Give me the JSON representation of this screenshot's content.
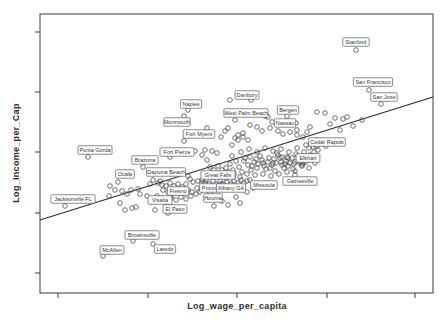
{
  "chart_data": {
    "type": "scatter",
    "title": "",
    "xlabel": "Log_wage_per_capita",
    "ylabel": "Log_Income_per_Cap",
    "legend": null,
    "grid": false,
    "axis_tick_numbers_visible": false,
    "colors": {
      "background": "#ffffff",
      "axis": "#3a3a3a",
      "point_stroke": "#4a4a4a",
      "line": "#2b2b2b",
      "label_box_fill": "#ffffff",
      "label_box_stroke": "#5a5a5a",
      "label_text": "#333333"
    },
    "plot_box_px": {
      "left": 40,
      "top": 14,
      "right": 433,
      "bottom": 293
    },
    "x_ticks_px": [
      58,
      148,
      237,
      327,
      415
    ],
    "y_ticks_px": [
      32,
      92,
      152,
      213,
      273
    ],
    "regression_line_px": {
      "x1": 40,
      "y1": 220,
      "x2": 433,
      "y2": 97
    },
    "point_radius": 2.3,
    "labeled_points": [
      {
        "name": "Stanford",
        "px": 356,
        "py": 50,
        "lx": 356,
        "ly": 42
      },
      {
        "name": "San Francisco",
        "px": 369,
        "py": 90,
        "lx": 373,
        "ly": 82
      },
      {
        "name": "San Jose",
        "px": 381,
        "py": 104,
        "lx": 384,
        "ly": 97
      },
      {
        "name": "Danbury",
        "px": 251,
        "py": 100,
        "lx": 247,
        "ly": 95
      },
      {
        "name": "Naples",
        "px": 188,
        "py": 110,
        "lx": 191,
        "ly": 104
      },
      {
        "name": "Monmouth",
        "px": 184,
        "py": 116,
        "lx": 177,
        "ly": 122
      },
      {
        "name": "West Palm Beach",
        "px": 268,
        "py": 117,
        "lx": 246,
        "ly": 113
      },
      {
        "name": "Bergen",
        "px": 287,
        "py": 116,
        "lx": 288,
        "ly": 110
      },
      {
        "name": "Nassau",
        "px": 296,
        "py": 123,
        "lx": 285,
        "ly": 123
      },
      {
        "name": "Fort Myers",
        "px": 184,
        "py": 141,
        "lx": 199,
        "ly": 134
      },
      {
        "name": "Fort Pierce",
        "px": 170,
        "py": 157,
        "lx": 177,
        "ly": 152
      },
      {
        "name": "Cedar Rapids",
        "px": 317,
        "py": 146,
        "lx": 327,
        "ly": 142
      },
      {
        "name": "Elkhart",
        "px": 303,
        "py": 163,
        "lx": 308,
        "ly": 158
      },
      {
        "name": "Punta Gorda",
        "px": 88,
        "py": 157,
        "lx": 95,
        "ly": 150
      },
      {
        "name": "Brazoria",
        "px": 143,
        "py": 167,
        "lx": 145,
        "ly": 160
      },
      {
        "name": "Ocala",
        "px": 118,
        "py": 182,
        "lx": 125,
        "ly": 174
      },
      {
        "name": "Daytona Beach",
        "px": 153,
        "py": 180,
        "lx": 166,
        "ly": 172
      },
      {
        "name": "Great Falls",
        "px": 202,
        "py": 180,
        "lx": 218,
        "ly": 175
      },
      {
        "name": "Provo",
        "px": 205,
        "py": 183,
        "lx": 209,
        "ly": 188
      },
      {
        "name": "Albany GA",
        "px": 221,
        "py": 184,
        "lx": 231,
        "ly": 188
      },
      {
        "name": "Houma",
        "px": 210,
        "py": 193,
        "lx": 213,
        "ly": 198
      },
      {
        "name": "Missoula",
        "px": 250,
        "py": 180,
        "lx": 264,
        "ly": 185
      },
      {
        "name": "Gainesville",
        "px": 295,
        "py": 175,
        "lx": 300,
        "ly": 181
      },
      {
        "name": "Jacksonville FL",
        "px": 65,
        "py": 206,
        "lx": 73,
        "ly": 199
      },
      {
        "name": "Fresno",
        "px": 171,
        "py": 196,
        "lx": 178,
        "ly": 191
      },
      {
        "name": "Visalia",
        "px": 151,
        "py": 202,
        "lx": 160,
        "ly": 200
      },
      {
        "name": "El Paso",
        "px": 168,
        "py": 213,
        "lx": 175,
        "ly": 209
      },
      {
        "name": "Brownsville",
        "px": 133,
        "py": 241,
        "lx": 142,
        "ly": 235
      },
      {
        "name": "McAllen",
        "px": 103,
        "py": 256,
        "lx": 112,
        "ly": 250
      },
      {
        "name": "Laredo",
        "px": 153,
        "py": 244,
        "lx": 165,
        "ly": 249
      }
    ],
    "cloud_points_px": [
      [
        317,
        112
      ],
      [
        325,
        113
      ],
      [
        335,
        118
      ],
      [
        347,
        117
      ],
      [
        343,
        119
      ],
      [
        340,
        130
      ],
      [
        353,
        126
      ],
      [
        362,
        120
      ],
      [
        330,
        124
      ],
      [
        250,
        125
      ],
      [
        228,
        128
      ],
      [
        238,
        135
      ],
      [
        243,
        133
      ],
      [
        235,
        138
      ],
      [
        235,
        120
      ],
      [
        278,
        131
      ],
      [
        283,
        134
      ],
      [
        290,
        132
      ],
      [
        297,
        135
      ],
      [
        262,
        131
      ],
      [
        270,
        128
      ],
      [
        257,
        127
      ],
      [
        265,
        116
      ],
      [
        272,
        122
      ],
      [
        297,
        130
      ],
      [
        307,
        132
      ],
      [
        303,
        137
      ],
      [
        310,
        127
      ],
      [
        207,
        128
      ],
      [
        225,
        131
      ],
      [
        221,
        137
      ],
      [
        232,
        145
      ],
      [
        238,
        140
      ],
      [
        243,
        137
      ],
      [
        248,
        140
      ],
      [
        230,
        100
      ],
      [
        205,
        150
      ],
      [
        212,
        151
      ],
      [
        217,
        153
      ],
      [
        202,
        155
      ],
      [
        195,
        151
      ],
      [
        207,
        160
      ],
      [
        226,
        168
      ],
      [
        230,
        164
      ],
      [
        233,
        170
      ],
      [
        236,
        161
      ],
      [
        239,
        167
      ],
      [
        242,
        172
      ],
      [
        245,
        158
      ],
      [
        248,
        165
      ],
      [
        251,
        170
      ],
      [
        254,
        162
      ],
      [
        257,
        168
      ],
      [
        260,
        156
      ],
      [
        263,
        163
      ],
      [
        266,
        169
      ],
      [
        269,
        158
      ],
      [
        272,
        165
      ],
      [
        275,
        171
      ],
      [
        278,
        155
      ],
      [
        281,
        162
      ],
      [
        284,
        168
      ],
      [
        287,
        157
      ],
      [
        290,
        163
      ],
      [
        293,
        169
      ],
      [
        296,
        154
      ],
      [
        299,
        161
      ],
      [
        302,
        166
      ],
      [
        305,
        158
      ],
      [
        247,
        174
      ],
      [
        255,
        175
      ],
      [
        263,
        174
      ],
      [
        271,
        176
      ],
      [
        279,
        174
      ],
      [
        287,
        172
      ],
      [
        295,
        171
      ],
      [
        241,
        152
      ],
      [
        249,
        149
      ],
      [
        257,
        152
      ],
      [
        265,
        148
      ],
      [
        273,
        151
      ],
      [
        281,
        149
      ],
      [
        289,
        152
      ],
      [
        297,
        148
      ],
      [
        232,
        156
      ],
      [
        244,
        161
      ],
      [
        250,
        157
      ],
      [
        256,
        159
      ],
      [
        262,
        160
      ],
      [
        268,
        162
      ],
      [
        274,
        159
      ],
      [
        280,
        158
      ],
      [
        286,
        161
      ],
      [
        292,
        158
      ],
      [
        298,
        156
      ],
      [
        304,
        152
      ],
      [
        309,
        148
      ],
      [
        234,
        174
      ],
      [
        228,
        172
      ],
      [
        222,
        170
      ],
      [
        218,
        166
      ],
      [
        214,
        170
      ],
      [
        210,
        167
      ],
      [
        252,
        166
      ],
      [
        258,
        164
      ],
      [
        264,
        166
      ],
      [
        270,
        168
      ],
      [
        276,
        163
      ],
      [
        282,
        165
      ],
      [
        288,
        166
      ],
      [
        294,
        164
      ],
      [
        300,
        163
      ],
      [
        306,
        162
      ],
      [
        310,
        155
      ],
      [
        314,
        152
      ],
      [
        318,
        150
      ],
      [
        311,
        143
      ],
      [
        316,
        140
      ],
      [
        321,
        143
      ],
      [
        326,
        146
      ],
      [
        306,
        145
      ],
      [
        313,
        147
      ],
      [
        198,
        181
      ],
      [
        202,
        183
      ],
      [
        206,
        180
      ],
      [
        209,
        184
      ],
      [
        213,
        181
      ],
      [
        216,
        184
      ],
      [
        220,
        181
      ],
      [
        223,
        184
      ],
      [
        227,
        182
      ],
      [
        231,
        184
      ],
      [
        234,
        181
      ],
      [
        238,
        183
      ],
      [
        241,
        180
      ],
      [
        244,
        183
      ],
      [
        247,
        181
      ],
      [
        240,
        177
      ],
      [
        233,
        177
      ],
      [
        226,
        178
      ],
      [
        190,
        179
      ],
      [
        193,
        182
      ],
      [
        188,
        176
      ],
      [
        150,
        184
      ],
      [
        158,
        183
      ],
      [
        160,
        181
      ],
      [
        166,
        186
      ],
      [
        170,
        183
      ],
      [
        174,
        186
      ],
      [
        178,
        184
      ],
      [
        182,
        187
      ],
      [
        186,
        184
      ],
      [
        163,
        190
      ],
      [
        168,
        192
      ],
      [
        172,
        190
      ],
      [
        176,
        193
      ],
      [
        180,
        190
      ],
      [
        184,
        193
      ],
      [
        188,
        190
      ],
      [
        192,
        192
      ],
      [
        157,
        196
      ],
      [
        162,
        198
      ],
      [
        166,
        200
      ],
      [
        171,
        198
      ],
      [
        176,
        200
      ],
      [
        181,
        197
      ],
      [
        186,
        199
      ],
      [
        191,
        196
      ],
      [
        196,
        194
      ],
      [
        200,
        192
      ],
      [
        197,
        188
      ],
      [
        162,
        185
      ],
      [
        110,
        186
      ],
      [
        115,
        190
      ],
      [
        122,
        191
      ],
      [
        127,
        194
      ],
      [
        131,
        190
      ],
      [
        138,
        189
      ],
      [
        147,
        196
      ],
      [
        120,
        203
      ],
      [
        125,
        210
      ],
      [
        132,
        208
      ],
      [
        136,
        207
      ],
      [
        109,
        196
      ],
      [
        140,
        194
      ],
      [
        155,
        210
      ],
      [
        207,
        199
      ],
      [
        214,
        206
      ],
      [
        222,
        201
      ],
      [
        228,
        205
      ],
      [
        236,
        197
      ],
      [
        240,
        203
      ],
      [
        247,
        192
      ],
      [
        253,
        188
      ],
      [
        277,
        153
      ],
      [
        282,
        157
      ],
      [
        288,
        158
      ],
      [
        273,
        163
      ],
      [
        285,
        164
      ],
      [
        295,
        162
      ],
      [
        302,
        165
      ],
      [
        309,
        168
      ],
      [
        315,
        163
      ]
    ]
  }
}
